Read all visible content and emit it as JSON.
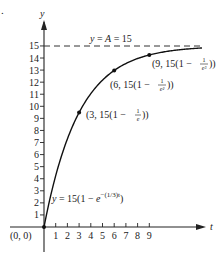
{
  "figure_marker": ".",
  "chart_data": {
    "type": "line",
    "title": "",
    "xlabel": "t",
    "ylabel": "y",
    "xlim": [
      0,
      9
    ],
    "ylim": [
      0,
      15
    ],
    "x_ticks": [
      "1",
      "2",
      "3",
      "4",
      "5",
      "6",
      "7",
      "8",
      "9"
    ],
    "y_ticks": [
      "1",
      "2",
      "3",
      "4",
      "5",
      "6",
      "7",
      "8",
      "9",
      "10",
      "11",
      "12",
      "13",
      "14",
      "15"
    ],
    "grid": false,
    "series": [
      {
        "name": "y = 15(1 - e^-(1/3)t)",
        "function": "15*(1-exp(-t/3))",
        "x": [
          0,
          1,
          2,
          3,
          4,
          5,
          6,
          7,
          8,
          9,
          10
        ],
        "values": [
          0,
          4.25,
          7.3,
          9.48,
          11.05,
          12.17,
          12.97,
          13.55,
          13.96,
          14.25,
          14.47
        ]
      }
    ],
    "asymptote": {
      "label": "y = A = 15",
      "y": 15,
      "style": "dashed"
    },
    "marked_points": [
      {
        "x": 0,
        "y": 0,
        "label": "(0, 0)"
      },
      {
        "x": 3,
        "y": 9.48,
        "label": "(3, 15(1 − 1/e))"
      },
      {
        "x": 6,
        "y": 12.97,
        "label": "(6, 15(1 − 1/e²))"
      },
      {
        "x": 9,
        "y": 14.25,
        "label": "(9, 15(1 − 1/e³))"
      }
    ]
  },
  "labels": {
    "y_axis": "y",
    "x_axis": "t",
    "asymptote": "y = A = 15",
    "origin": "(0, 0)",
    "curve_eq_main": "y = 15(1 − e",
    "curve_eq_exp": "−(1/3)t",
    "curve_eq_close": ")",
    "p3_main": "(3, 15(1 − ",
    "p3_num": "1",
    "p3_den": "e",
    "p3_close": "))",
    "p6_main": "(6, 15(1 − ",
    "p6_num": "1",
    "p6_den": "e²",
    "p6_close": "))",
    "p9_main": "(9, 15(1 − ",
    "p9_num": "1",
    "p9_den": "e³",
    "p9_close": "))"
  }
}
